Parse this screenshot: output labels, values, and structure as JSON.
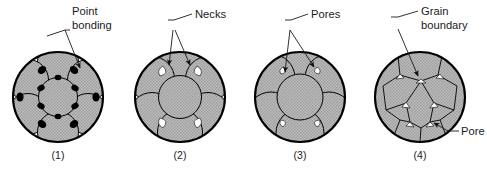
{
  "figure": {
    "title_visible": false,
    "background_color": "#ffffff",
    "stroke_color": "#000000",
    "grain_fill_color": "#b3b3b3",
    "pore_fill_color": "#ffffff",
    "text_color": "#1a1a1a"
  },
  "panels": [
    {
      "id": "panel-1",
      "caption": "(1)",
      "label": "Point bonding",
      "label_line1": "Point",
      "label_line2": "bonding",
      "arrow_count": 1,
      "stage": "Initial packing of spherical particles touching at points",
      "grain_shape": "circle",
      "grain_count": 7,
      "pore_appearance": "large white curved-triangle voids between spheres"
    },
    {
      "id": "panel-2",
      "caption": "(2)",
      "label": "Necks",
      "label_line1": "Necks",
      "label_line2": "",
      "arrow_count": 2,
      "stage": "Necks form between adjacent particles",
      "grain_shape": "circle",
      "grain_count": 7,
      "pore_appearance": "white triangular voids shrinking as necks grow"
    },
    {
      "id": "panel-3",
      "caption": "(3)",
      "label": "Pores",
      "label_line1": "Pores",
      "label_line2": "",
      "arrow_count": 2,
      "stage": "Particles coalesce further; isolated pores remain",
      "grain_shape": "circle",
      "grain_count": 7,
      "pore_appearance": "small white triangular pores at three-grain junctions"
    },
    {
      "id": "panel-4",
      "caption": "(4)",
      "label": "Grain boundary",
      "label_line1": "Grain",
      "label_line2": "boundary",
      "secondary_label": "Pore",
      "arrow_count": 2,
      "stage": "Full densification into polygonal grains separated by grain boundaries",
      "grain_shape": "polygon",
      "grain_count": 7,
      "pore_appearance": "tiny residual pores at grain triple points"
    }
  ],
  "captions": [
    "(1)",
    "(2)",
    "(3)",
    "(4)"
  ],
  "labels": [
    "Point bonding",
    "Necks",
    "Pores",
    "Grain boundary",
    "Pore"
  ]
}
